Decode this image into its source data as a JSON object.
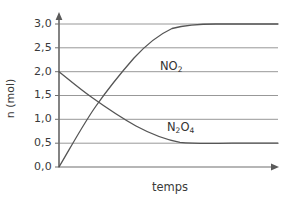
{
  "chart_data": {
    "type": "line",
    "title": "",
    "xlabel": "temps",
    "ylabel": "n (mol)",
    "ylim": [
      0.0,
      3.0
    ],
    "xlim": [
      0,
      10
    ],
    "grid": true,
    "legend_position": "inline-annotations",
    "ytick_labels": [
      "3,0",
      "2,5",
      "2,0",
      "1,5",
      "1,0",
      "0,5",
      "0,0"
    ],
    "ytick_values": [
      3.0,
      2.5,
      2.0,
      1.5,
      1.0,
      0.5,
      0.0
    ],
    "xtick_labels": [],
    "series": [
      {
        "name": "NO2",
        "label_html": "NO<sub>2</sub>",
        "start_value": 0.0,
        "end_value": 3.0,
        "shape": "rising-exponential-plateau",
        "color": "#555555",
        "x": [
          0.0,
          0.5,
          1.0,
          1.5,
          2.0,
          2.5,
          3.0,
          3.5,
          4.0,
          4.5,
          5.0,
          5.5,
          6.0,
          7.0,
          8.0,
          9.0,
          10.0
        ],
        "values": [
          0.0,
          0.56,
          1.04,
          1.45,
          1.8,
          2.1,
          2.34,
          2.55,
          2.72,
          2.83,
          2.9,
          2.95,
          2.98,
          3.0,
          3.0,
          3.0,
          3.0
        ]
      },
      {
        "name": "N2O4",
        "label_html": "N<sub>2</sub>O<sub>4</sub>",
        "start_value": 2.0,
        "end_value": 0.5,
        "shape": "decaying-exponential-plateau",
        "color": "#555555",
        "x": [
          0.0,
          0.5,
          1.0,
          1.5,
          2.0,
          2.5,
          3.0,
          3.5,
          4.0,
          4.5,
          5.0,
          5.5,
          6.0,
          7.0,
          8.0,
          9.0,
          10.0
        ],
        "values": [
          2.0,
          1.72,
          1.48,
          1.28,
          1.1,
          0.95,
          0.83,
          0.73,
          0.64,
          0.59,
          0.55,
          0.53,
          0.51,
          0.5,
          0.5,
          0.5,
          0.5
        ]
      }
    ],
    "annotations": [
      {
        "text": "NO2",
        "x_px": 160,
        "y_px": 60
      },
      {
        "text": "N2O4",
        "x_px": 167,
        "y_px": 121
      }
    ],
    "crossing_point": {
      "value": 1.25
    }
  },
  "axes": {
    "y_arrow": "up-arrow-icon",
    "x_arrow": "right-arrow-icon",
    "axis_color": "#6e6e6e",
    "grid_color": "#8c8c8c"
  }
}
